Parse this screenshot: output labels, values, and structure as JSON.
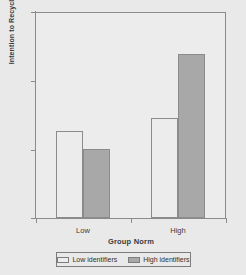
{
  "chart_data": {
    "type": "bar",
    "title": "",
    "xlabel": "Group Norm",
    "ylabel": "Intention to Recycle",
    "categories": [
      "Low",
      "High"
    ],
    "series": [
      {
        "name": "Low identifiers",
        "values": [
          5.27,
          5.46
        ],
        "color": "#ececec"
      },
      {
        "name": "High identifiers",
        "values": [
          5.01,
          6.4
        ],
        "color": "#a8a8a8"
      }
    ],
    "ylim": [
      4,
      7
    ],
    "yticks": [
      4,
      5,
      6,
      7
    ],
    "ytick_labels": [
      "4",
      "5",
      "6",
      "7"
    ],
    "grid": false,
    "legend_position": "bottom"
  },
  "axes": {
    "y_title": "Intention to Recycle",
    "x_title": "Group Norm",
    "y_tick_labels": [
      "7",
      "6",
      "5",
      "4"
    ],
    "x_tick_labels": [
      "Low",
      "High"
    ]
  },
  "legend": {
    "entries": [
      {
        "label": "Low identifiers"
      },
      {
        "label": "High identifiers"
      }
    ]
  },
  "colors": {
    "background": "#e9e9e9",
    "plot_background": "#ececec",
    "axis": "#8b8b8b",
    "light_bar": "#ececec",
    "dark_bar": "#a8a8a8",
    "text": "#3a3a3a"
  }
}
